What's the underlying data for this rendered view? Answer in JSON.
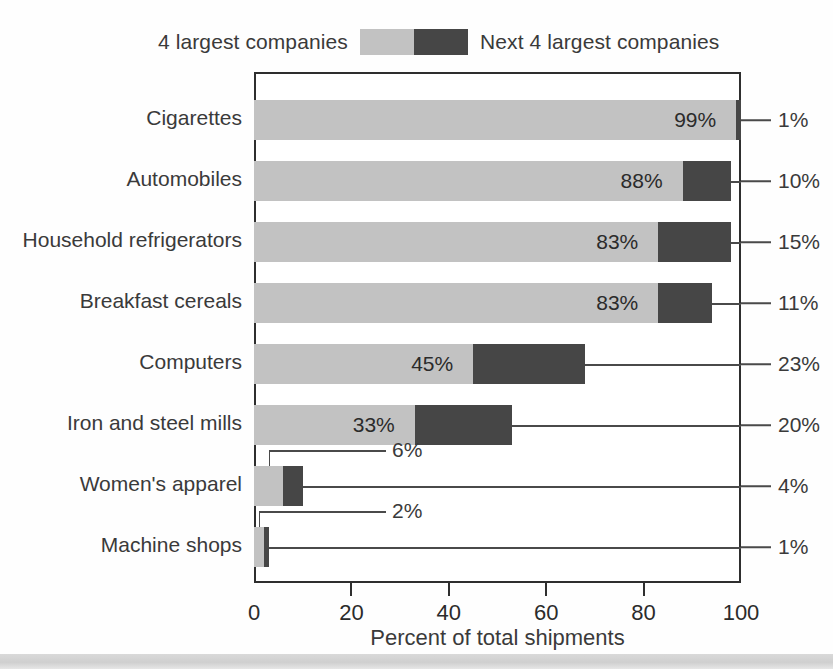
{
  "legend": {
    "left_label": "4 largest companies",
    "right_label": "Next 4 largest companies",
    "light_color": "#c2c2c2",
    "dark_color": "#464646"
  },
  "axis": {
    "x_title": "Percent of total shipments",
    "x_ticks": [
      "0",
      "20",
      "40",
      "60",
      "80",
      "100"
    ],
    "x_min": 0,
    "x_max": 100
  },
  "chart_data": {
    "type": "bar",
    "orientation": "horizontal",
    "stacked": true,
    "title": "",
    "subtitle": "",
    "xlabel": "Percent of total shipments",
    "ylabel": "",
    "xlim": [
      0,
      100
    ],
    "xticks": [
      0,
      20,
      40,
      60,
      80,
      100
    ],
    "grid": false,
    "legend_position": "top",
    "categories": [
      "Cigarettes",
      "Automobiles",
      "Household refrigerators",
      "Breakfast cereals",
      "Computers",
      "Iron and steel mills",
      "Women's apparel",
      "Machine shops"
    ],
    "series": [
      {
        "name": "4 largest companies",
        "color": "#c2c2c2",
        "values": [
          99,
          88,
          83,
          83,
          45,
          33,
          6,
          2
        ],
        "labels": [
          "99%",
          "88%",
          "83%",
          "83%",
          "45%",
          "33%",
          "6%",
          "2%"
        ]
      },
      {
        "name": "Next 4 largest companies",
        "color": "#464646",
        "values": [
          1,
          10,
          15,
          11,
          23,
          20,
          4,
          1
        ],
        "labels": [
          "1%",
          "10%",
          "15%",
          "11%",
          "23%",
          "20%",
          "4%",
          "1%"
        ]
      }
    ]
  },
  "rows": [
    {
      "category": "Cigarettes",
      "light": 99,
      "dark": 1,
      "light_label": "99%",
      "dark_label": "1%",
      "light_label_inside": true,
      "callout": "none"
    },
    {
      "category": "Automobiles",
      "light": 88,
      "dark": 10,
      "light_label": "88%",
      "dark_label": "10%",
      "light_label_inside": true,
      "callout": "none"
    },
    {
      "category": "Household refrigerators",
      "light": 83,
      "dark": 15,
      "light_label": "83%",
      "dark_label": "15%",
      "light_label_inside": true,
      "callout": "none"
    },
    {
      "category": "Breakfast cereals",
      "light": 83,
      "dark": 11,
      "light_label": "83%",
      "dark_label": "11%",
      "light_label_inside": true,
      "callout": "none"
    },
    {
      "category": "Computers",
      "light": 45,
      "dark": 23,
      "light_label": "45%",
      "dark_label": "23%",
      "light_label_inside": true,
      "callout": "none"
    },
    {
      "category": "Iron and steel mills",
      "light": 33,
      "dark": 20,
      "light_label": "33%",
      "dark_label": "20%",
      "light_label_inside": true,
      "callout": "none"
    },
    {
      "category": "Women's apparel",
      "light": 6,
      "dark": 4,
      "light_label": "6%",
      "dark_label": "4%",
      "light_label_inside": false,
      "callout": "bracket"
    },
    {
      "category": "Machine shops",
      "light": 2,
      "dark": 1,
      "light_label": "2%",
      "dark_label": "1%",
      "light_label_inside": false,
      "callout": "bracket"
    }
  ]
}
